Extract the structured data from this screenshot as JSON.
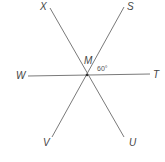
{
  "diagram": {
    "type": "intersecting-lines",
    "center": {
      "label": "M",
      "x": 87,
      "y": 75
    },
    "lines": [
      {
        "name": "line-XU",
        "from": {
          "label": "X",
          "x": 50,
          "y": 8
        },
        "to": {
          "label": "U",
          "x": 124,
          "y": 137
        }
      },
      {
        "name": "line-SV",
        "from": {
          "label": "S",
          "x": 124,
          "y": 7
        },
        "to": {
          "label": "V",
          "x": 52,
          "y": 137
        }
      },
      {
        "name": "line-WT",
        "from": {
          "label": "W",
          "x": 28,
          "y": 76
        },
        "to": {
          "label": "T",
          "x": 150,
          "y": 74
        }
      }
    ],
    "points": {
      "X": "X",
      "S": "S",
      "M": "M",
      "W": "W",
      "T": "T",
      "V": "V",
      "U": "U"
    },
    "angle_label": "60°",
    "colors": {
      "line": "#7a7a7a",
      "text": "#444444"
    }
  }
}
